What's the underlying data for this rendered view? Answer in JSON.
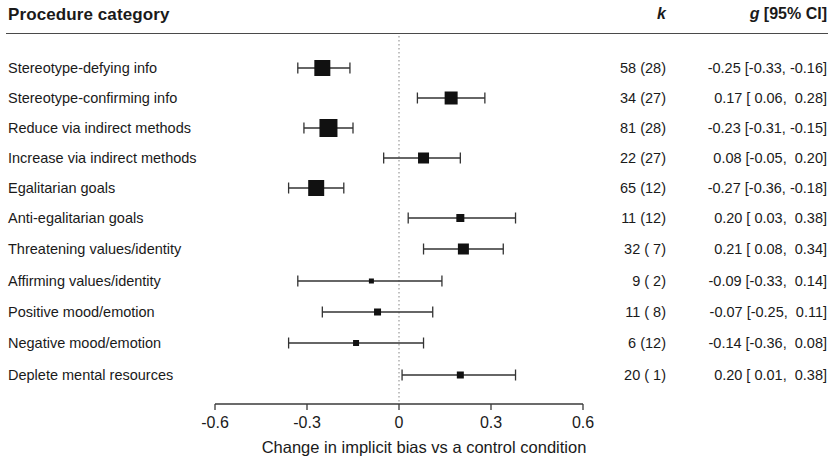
{
  "header": {
    "title": "Procedure category",
    "k_label": "k",
    "g_label_italic": "g",
    "g_label_rest": " [95% CI]"
  },
  "axis": {
    "caption": "Change in implicit bias vs a control condition",
    "tick_labels": [
      "-0.6",
      "-0.3",
      "0",
      "0.3",
      "0.6"
    ],
    "tick_values": [
      -0.6,
      -0.3,
      0,
      0.3,
      0.6
    ],
    "x_min": -0.6,
    "x_max": 0.6,
    "reference_line_value": 0,
    "reference_line_style": "dotted"
  },
  "colors": {
    "marker": "#111111",
    "line": "#333333",
    "axis": "#3a3a3a",
    "reference": "#9a9a9a",
    "text": "#1a1a1a",
    "background": "#ffffff"
  },
  "chart_data": {
    "type": "scatter",
    "title": "",
    "subtitle": "",
    "xlabel": "Change in implicit bias vs a control condition",
    "ylabel": "Procedure category",
    "xlim": [
      -0.6,
      0.6
    ],
    "grid": false,
    "legend": "none",
    "plot_style": "forest-plot",
    "columns": [
      "Procedure category",
      "k",
      "g [95% CI]"
    ],
    "rows": [
      {
        "label": "Stereotype-defying info",
        "k": "58 (28)",
        "k_studies": 58,
        "k_samples": 28,
        "g": -0.25,
        "ci_low": -0.33,
        "ci_high": -0.16,
        "ci_text": "-0.25 [-0.33, -0.16]",
        "marker_size": 16
      },
      {
        "label": "Stereotype-confirming info",
        "k": "34 (27)",
        "k_studies": 34,
        "k_samples": 27,
        "g": 0.17,
        "ci_low": 0.06,
        "ci_high": 0.28,
        "ci_text": "0.17 [ 0.06,  0.28]",
        "marker_size": 13
      },
      {
        "label": "Reduce via indirect methods",
        "k": "81 (28)",
        "k_studies": 81,
        "k_samples": 28,
        "g": -0.23,
        "ci_low": -0.31,
        "ci_high": -0.15,
        "ci_text": "-0.23 [-0.31, -0.15]",
        "marker_size": 18
      },
      {
        "label": "Increase via indirect methods",
        "k": "22 (27)",
        "k_studies": 22,
        "k_samples": 27,
        "g": 0.08,
        "ci_low": -0.05,
        "ci_high": 0.2,
        "ci_text": "0.08 [-0.05,  0.20]",
        "marker_size": 11
      },
      {
        "label": "Egalitarian goals",
        "k": "65 (12)",
        "k_studies": 65,
        "k_samples": 12,
        "g": -0.27,
        "ci_low": -0.36,
        "ci_high": -0.18,
        "ci_text": "-0.27 [-0.36, -0.18]",
        "marker_size": 16
      },
      {
        "label": "Anti-egalitarian goals",
        "k": "11 (12)",
        "k_studies": 11,
        "k_samples": 12,
        "g": 0.2,
        "ci_low": 0.03,
        "ci_high": 0.38,
        "ci_text": "0.20 [ 0.03,  0.38]",
        "marker_size": 8
      },
      {
        "label": "Threatening values/identity",
        "k": "32 ( 7)",
        "k_studies": 32,
        "k_samples": 7,
        "g": 0.21,
        "ci_low": 0.08,
        "ci_high": 0.34,
        "ci_text": "0.21 [ 0.08,  0.34]",
        "marker_size": 11
      },
      {
        "label": "Affirming values/identity",
        "k": "9 ( 2)",
        "k_studies": 9,
        "k_samples": 2,
        "g": -0.09,
        "ci_low": -0.33,
        "ci_high": 0.14,
        "ci_text": "-0.09 [-0.33,  0.14]",
        "marker_size": 5
      },
      {
        "label": "Positive mood/emotion",
        "k": "11 ( 8)",
        "k_studies": 11,
        "k_samples": 8,
        "g": -0.07,
        "ci_low": -0.25,
        "ci_high": 0.11,
        "ci_text": "-0.07 [-0.25,  0.11]",
        "marker_size": 7
      },
      {
        "label": "Negative mood/emotion",
        "k": "6 (12)",
        "k_studies": 6,
        "k_samples": 12,
        "g": -0.14,
        "ci_low": -0.36,
        "ci_high": 0.08,
        "ci_text": "-0.14 [-0.36,  0.08]",
        "marker_size": 6
      },
      {
        "label": "Deplete mental resources",
        "k": "20 ( 1)",
        "k_studies": 20,
        "k_samples": 1,
        "g": 0.2,
        "ci_low": 0.01,
        "ci_high": 0.38,
        "ci_text": "0.20 [ 0.01,  0.38]",
        "marker_size": 7
      }
    ]
  },
  "layout": {
    "row_y": [
      68,
      98,
      128,
      158,
      188,
      218,
      249,
      281,
      312,
      343,
      375
    ],
    "axis_y": 404,
    "x_pixel_min": 215,
    "x_pixel_max": 583
  }
}
